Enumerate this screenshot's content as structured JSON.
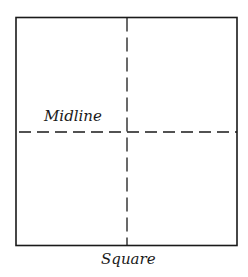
{
  "diagram": {
    "title": "Square",
    "shape": "square",
    "labels": {
      "midline": "Midline",
      "caption": "Square"
    },
    "square": {
      "x": 16,
      "y": 17,
      "width": 221,
      "height": 229
    },
    "lines": {
      "horizontal_midline": {
        "style": "dashed",
        "y": 132
      },
      "vertical_midline": {
        "style": "dashed",
        "x": 127
      }
    },
    "colors": {
      "stroke": "#1a1a1a",
      "background": "#ffffff"
    }
  }
}
